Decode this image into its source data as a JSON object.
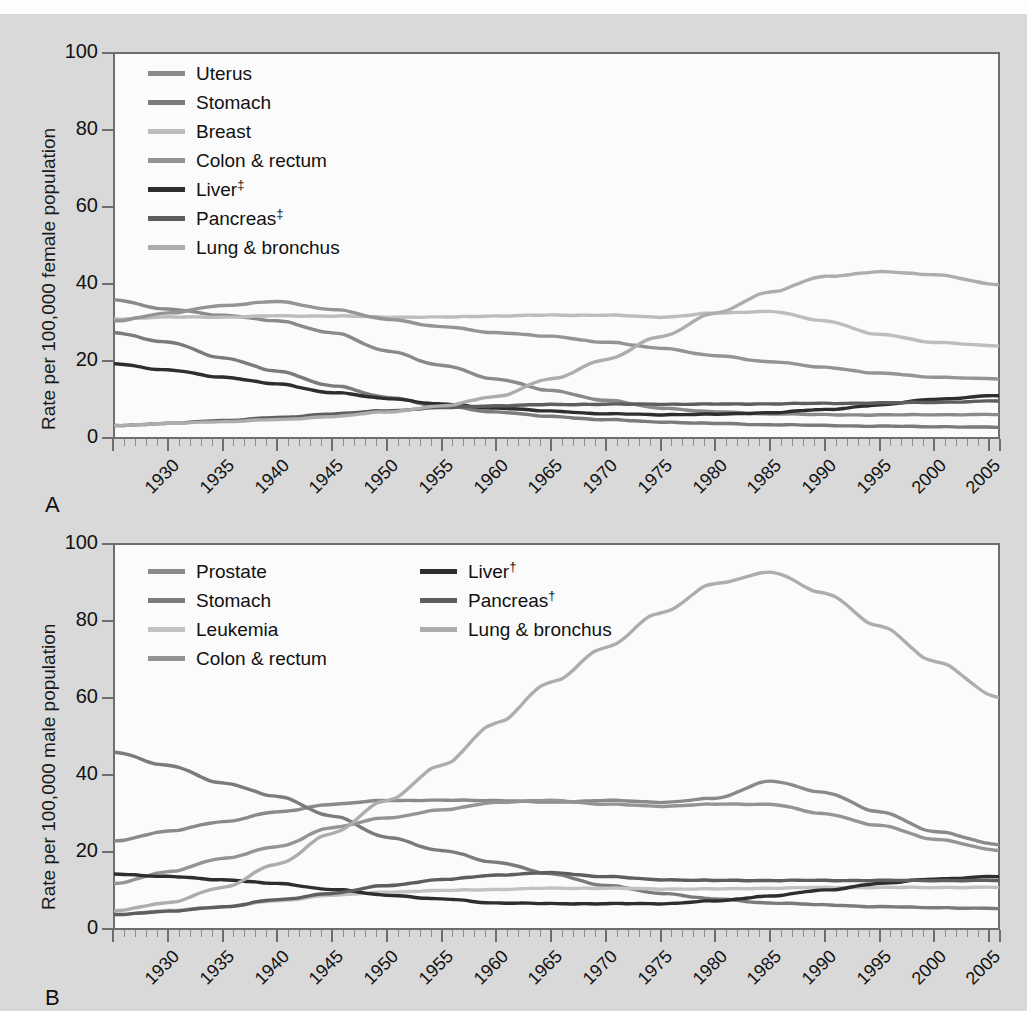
{
  "figure": {
    "background_color": "#d9d9d9",
    "plot_background_color": "#fbfbfb",
    "axis_color": "#6e6e6e",
    "panel_a_letter": "A",
    "panel_b_letter": "B"
  },
  "panel_a": {
    "ylabel": "Rate per 100,000 female population",
    "yticks": [
      "0",
      "20",
      "40",
      "60",
      "80",
      "100"
    ],
    "xticks": [
      "1930",
      "1935",
      "1940",
      "1945",
      "1950",
      "1955",
      "1960",
      "1965",
      "1970",
      "1975",
      "1980",
      "1985",
      "1990",
      "1995",
      "2000",
      "2005",
      "2011"
    ],
    "legend": [
      {
        "label": "Uterus",
        "sup": "",
        "color": "#8a8a8a"
      },
      {
        "label": "Stomach",
        "sup": "",
        "color": "#7b7b7b"
      },
      {
        "label": "Breast",
        "sup": "",
        "color": "#bdbdbd"
      },
      {
        "label": "Colon & rectum",
        "sup": "",
        "color": "#949494"
      },
      {
        "label": "Liver",
        "sup": "‡",
        "color": "#2e2e2e"
      },
      {
        "label": "Pancreas",
        "sup": "‡",
        "color": "#5e5e5e"
      },
      {
        "label": "Lung & bronchus",
        "sup": "",
        "color": "#adadad"
      }
    ]
  },
  "panel_b": {
    "ylabel": "Rate per 100,000 male population",
    "yticks": [
      "0",
      "20",
      "40",
      "60",
      "80",
      "100"
    ],
    "xticks": [
      "1930",
      "1935",
      "1940",
      "1945",
      "1950",
      "1955",
      "1960",
      "1965",
      "1970",
      "1975",
      "1980",
      "1985",
      "1990",
      "1995",
      "2000",
      "2005",
      "2011"
    ],
    "legend_col1": [
      {
        "label": "Prostate",
        "sup": "",
        "color": "#8a8a8a"
      },
      {
        "label": "Stomach",
        "sup": "",
        "color": "#7b7b7b"
      },
      {
        "label": "Leukemia",
        "sup": "",
        "color": "#c2c2c2"
      },
      {
        "label": "Colon & rectum",
        "sup": "",
        "color": "#949494"
      }
    ],
    "legend_col2": [
      {
        "label": "Liver",
        "sup": "†",
        "color": "#2e2e2e"
      },
      {
        "label": "Pancreas",
        "sup": "†",
        "color": "#5e5e5e"
      },
      {
        "label": "Lung & bronchus",
        "sup": "",
        "color": "#adadad"
      }
    ]
  },
  "chart_data": [
    {
      "type": "line",
      "panel": "A",
      "title": "",
      "xlabel": "",
      "ylabel": "Rate per 100,000 female population",
      "xlim": [
        1930,
        2011
      ],
      "ylim": [
        0,
        100
      ],
      "grid": false,
      "legend_position": "inside top-left",
      "x": [
        1930,
        1935,
        1940,
        1945,
        1950,
        1955,
        1960,
        1965,
        1970,
        1975,
        1980,
        1985,
        1990,
        1995,
        2000,
        2005,
        2011
      ],
      "series": [
        {
          "name": "Uterus",
          "color": "#8a8a8a",
          "values": [
            36.0,
            33.5,
            32.0,
            30.5,
            27.5,
            22.8,
            19.0,
            15.5,
            12.5,
            10.0,
            8.0,
            7.0,
            6.5,
            6.3,
            6.2,
            6.3,
            6.3
          ]
        },
        {
          "name": "Stomach",
          "color": "#7b7b7b",
          "values": [
            27.5,
            25.0,
            21.0,
            17.5,
            13.8,
            10.8,
            8.5,
            7.0,
            5.8,
            5.0,
            4.4,
            4.0,
            3.7,
            3.5,
            3.3,
            3.2,
            3.0
          ]
        },
        {
          "name": "Breast",
          "color": "#bdbdbd",
          "values": [
            31.0,
            31.5,
            31.5,
            31.8,
            31.8,
            31.5,
            31.5,
            31.8,
            32.0,
            32.0,
            31.5,
            32.5,
            33.0,
            30.5,
            27.0,
            25.0,
            24.0
          ]
        },
        {
          "name": "Colon & rectum",
          "color": "#949494",
          "values": [
            30.5,
            32.5,
            34.5,
            35.5,
            33.5,
            31.0,
            29.0,
            27.5,
            26.5,
            25.0,
            23.5,
            21.5,
            20.0,
            18.5,
            17.0,
            16.0,
            15.5
          ]
        },
        {
          "name": "Liver",
          "sup": "‡",
          "color": "#2e2e2e",
          "values": [
            19.5,
            17.8,
            16.0,
            14.2,
            12.0,
            10.5,
            9.0,
            8.0,
            7.2,
            6.5,
            6.3,
            6.4,
            6.8,
            7.6,
            8.8,
            10.3,
            11.2
          ]
        },
        {
          "name": "Pancreas",
          "sup": "‡",
          "color": "#5e5e5e",
          "values": [
            3.5,
            4.0,
            4.8,
            5.5,
            6.5,
            7.3,
            8.1,
            8.6,
            8.9,
            9.0,
            9.0,
            9.0,
            9.1,
            9.2,
            9.3,
            9.5,
            9.8
          ]
        },
        {
          "name": "Lung & bronchus",
          "color": "#adadad",
          "values": [
            3.5,
            4.0,
            4.5,
            5.0,
            5.8,
            7.0,
            8.5,
            11.0,
            15.5,
            20.5,
            26.5,
            32.5,
            38.0,
            42.0,
            43.2,
            42.5,
            39.8
          ]
        }
      ]
    },
    {
      "type": "line",
      "panel": "B",
      "title": "",
      "xlabel": "",
      "ylabel": "Rate per 100,000 male population",
      "xlim": [
        1930,
        2011
      ],
      "ylim": [
        0,
        100
      ],
      "grid": false,
      "legend_position": "inside top-left, two columns",
      "x": [
        1930,
        1935,
        1940,
        1945,
        1950,
        1955,
        1960,
        1965,
        1970,
        1975,
        1980,
        1985,
        1990,
        1995,
        2000,
        2005,
        2011
      ],
      "series": [
        {
          "name": "Prostate",
          "color": "#8a8a8a",
          "values": [
            23.0,
            25.5,
            28.0,
            30.5,
            32.5,
            33.5,
            33.5,
            33.5,
            33.0,
            33.5,
            33.0,
            34.0,
            38.5,
            35.5,
            30.5,
            25.5,
            22.0
          ]
        },
        {
          "name": "Stomach",
          "color": "#7b7b7b",
          "values": [
            46.0,
            42.5,
            38.0,
            34.5,
            29.5,
            24.0,
            20.5,
            17.5,
            14.5,
            11.5,
            9.5,
            8.0,
            7.0,
            6.5,
            6.0,
            5.8,
            5.5
          ]
        },
        {
          "name": "Leukemia",
          "color": "#c2c2c2",
          "values": [
            4.0,
            5.0,
            6.0,
            7.5,
            9.0,
            9.8,
            10.2,
            10.5,
            10.8,
            10.8,
            10.6,
            10.6,
            10.8,
            11.0,
            11.0,
            11.0,
            11.0
          ]
        },
        {
          "name": "Colon & rectum",
          "color": "#949494",
          "values": [
            12.0,
            15.0,
            18.5,
            21.5,
            26.5,
            29.0,
            31.0,
            33.0,
            33.5,
            32.5,
            32.0,
            32.5,
            32.5,
            30.0,
            27.0,
            23.5,
            20.5
          ]
        },
        {
          "name": "Liver",
          "sup": "†",
          "color": "#2e2e2e",
          "values": [
            14.5,
            13.8,
            13.0,
            12.0,
            10.5,
            9.0,
            8.0,
            7.0,
            6.8,
            6.8,
            6.8,
            7.5,
            8.8,
            10.3,
            12.0,
            13.2,
            13.8
          ]
        },
        {
          "name": "Pancreas",
          "sup": "†",
          "color": "#5e5e5e",
          "values": [
            4.0,
            4.8,
            6.0,
            7.8,
            9.5,
            11.5,
            13.0,
            14.2,
            14.8,
            13.8,
            13.0,
            12.8,
            12.8,
            12.8,
            12.8,
            12.8,
            12.8
          ]
        },
        {
          "name": "Lung & bronchus",
          "color": "#adadad",
          "values": [
            5.0,
            7.0,
            11.0,
            17.0,
            25.0,
            33.5,
            42.5,
            53.5,
            64.0,
            73.0,
            82.0,
            89.5,
            92.5,
            87.0,
            78.5,
            69.5,
            60.0
          ]
        }
      ]
    }
  ],
  "bleed_text": [
    "Congenital Vascular",
    "of the Lesion and Growth"
  ]
}
